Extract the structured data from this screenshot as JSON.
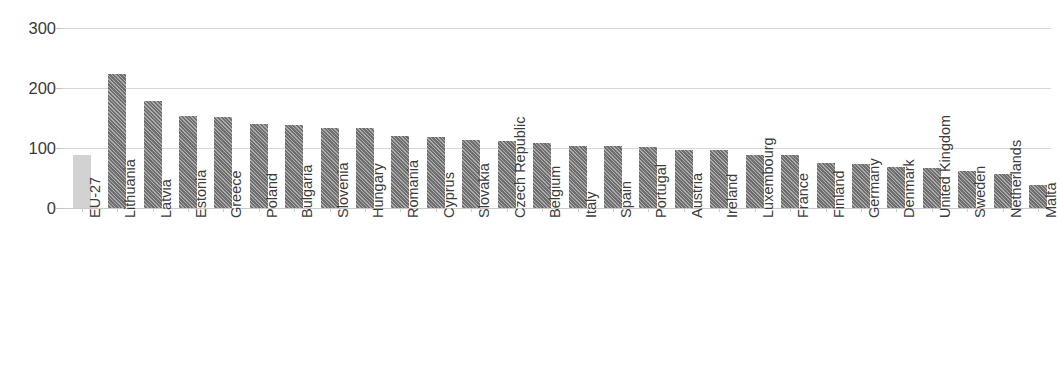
{
  "chart_data": {
    "type": "bar",
    "title": "",
    "subtitle": "",
    "xlabel": "",
    "ylabel": "",
    "ylim": [
      0,
      320
    ],
    "yticks": [
      0,
      100,
      200,
      300
    ],
    "ytick_labels": [
      "0",
      "100",
      "200",
      "300"
    ],
    "grid": "horizontal",
    "legend": "none",
    "categories": [
      "EU-27",
      "Lithuania",
      "Latvia",
      "Estonia",
      "Greece",
      "Poland",
      "Bulgaria",
      "Slovenia",
      "Hungary",
      "Romania",
      "Cyprus",
      "Slovakia",
      "Czech Republic",
      "Belgium",
      "Italy",
      "Spain",
      "Portugal",
      "Austria",
      "Ireland",
      "Luxembourg",
      "France",
      "Finland",
      "Germany",
      "Denmark",
      "United Kingdom",
      "Sweden",
      "Netherlands",
      "Malta"
    ],
    "values": [
      88,
      223,
      179,
      153,
      151,
      140,
      139,
      134,
      133,
      120,
      118,
      113,
      111,
      109,
      104,
      103,
      101,
      97,
      97,
      88,
      88,
      75,
      73,
      68,
      67,
      61,
      57,
      39
    ],
    "series": [
      {
        "name": "Country value",
        "values": [
          88,
          223,
          179,
          153,
          151,
          140,
          139,
          134,
          133,
          120,
          118,
          113,
          111,
          109,
          104,
          103,
          101,
          97,
          97,
          88,
          88,
          75,
          73,
          68,
          67,
          61,
          57,
          39
        ]
      }
    ],
    "highlight_category": "EU-27",
    "colors": {
      "bar_fill": "#6f6f6f",
      "bar_hatch": "#ffffff",
      "highlight_fill": "#d2d2d2",
      "gridline": "#d8d8d8",
      "axis": "#c9c9c9",
      "tick_text": "#3a3a3a",
      "label_text": "#3c3c3c",
      "background": "#ffffff"
    },
    "bar_style": "diagonal-hatch",
    "highlight_bar_style": "solid-light-gray",
    "xlabel_rotation": -90,
    "top_cropped_text": ""
  }
}
